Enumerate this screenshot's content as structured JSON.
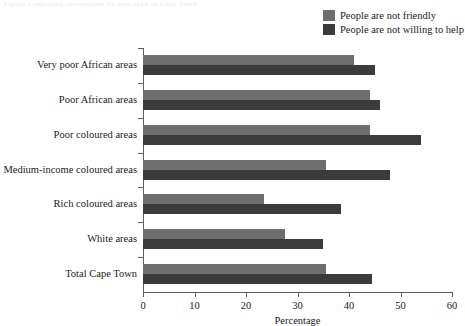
{
  "top_fragment": "Figure comparing perceptions by area type in Cape Town",
  "legend": {
    "position": "top-right",
    "items": [
      {
        "label": "People are not friendly",
        "color": "#6e6e6e"
      },
      {
        "label": "People are not willing to help",
        "color": "#3b3b3b"
      }
    ]
  },
  "chart_data": {
    "type": "bar",
    "orientation": "horizontal",
    "title": "",
    "subtitle": "",
    "xlabel": "Percentage",
    "ylabel": "",
    "xlim": [
      0,
      60
    ],
    "xticks": [
      0,
      10,
      20,
      30,
      40,
      50,
      60
    ],
    "grid": false,
    "legend_position": "top-right",
    "categories": [
      "Very poor African areas",
      "Poor African areas",
      "Poor coloured areas",
      "Medium-income coloured areas",
      "Rich coloured areas",
      "White areas",
      "Total Cape Town"
    ],
    "series": [
      {
        "name": "People are not friendly",
        "color": "#6e6e6e",
        "values": [
          41,
          44,
          44,
          35.5,
          23.5,
          27.5,
          35.5
        ]
      },
      {
        "name": "People are not willing to help",
        "color": "#3b3b3b",
        "values": [
          45,
          46,
          54,
          48,
          38.5,
          35,
          44.5
        ]
      }
    ]
  }
}
